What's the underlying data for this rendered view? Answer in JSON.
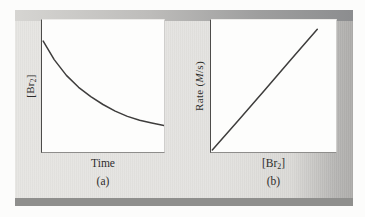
{
  "figure": {
    "panels": [
      {
        "id": "a",
        "caption": "(a)",
        "xlabel": "Time",
        "ylabel_parts": {
          "pre": "[Br",
          "sub": "2",
          "post": "]"
        }
      },
      {
        "id": "b",
        "caption": "(b)",
        "xlabel_parts": {
          "pre": "[Br",
          "sub": "2",
          "post": "]"
        },
        "ylabel_parts": {
          "pre": "Rate (",
          "italic": "M",
          "post": "/s)"
        }
      }
    ]
  },
  "colors": {
    "curve": "#3e3d3c",
    "axis_left": "#4d4c4a",
    "axis_bottom": "#8e8d8b",
    "panel_background_left": "#e6e5e2",
    "panel_background_right": "#aeadab",
    "top_band_left": "#d6d5d2",
    "top_band_right": "#8c8d8f",
    "bottom_bar": "#8f8f8d",
    "plot_background": "#fdfdfc"
  },
  "chart_data": [
    {
      "type": "line",
      "panel": "a",
      "title": "(a)",
      "xlabel": "Time",
      "ylabel": "[Br2]",
      "axes_numeric": false,
      "x_range": [
        0,
        1
      ],
      "y_range": [
        0,
        1
      ],
      "grid": false,
      "legend": false,
      "description": "Br2 concentration decreases with time along a concave-up exponential-decay curve",
      "points": [
        [
          0.01,
          0.84
        ],
        [
          0.1,
          0.7
        ],
        [
          0.2,
          0.58
        ],
        [
          0.3,
          0.49
        ],
        [
          0.4,
          0.42
        ],
        [
          0.5,
          0.36
        ],
        [
          0.6,
          0.31
        ],
        [
          0.7,
          0.27
        ],
        [
          0.8,
          0.24
        ],
        [
          0.9,
          0.22
        ],
        [
          1.0,
          0.2
        ]
      ]
    },
    {
      "type": "line",
      "panel": "b",
      "title": "(b)",
      "xlabel": "[Br2]",
      "ylabel": "Rate (M/s)",
      "axes_numeric": false,
      "x_range": [
        0,
        1
      ],
      "y_range": [
        0,
        1
      ],
      "grid": false,
      "legend": false,
      "description": "Rate increases linearly with Br2 concentration, starting at the origin",
      "points": [
        [
          0.01,
          0.015
        ],
        [
          0.22,
          0.24
        ],
        [
          0.43,
          0.47
        ],
        [
          0.64,
          0.7
        ],
        [
          0.85,
          0.93
        ]
      ]
    }
  ]
}
